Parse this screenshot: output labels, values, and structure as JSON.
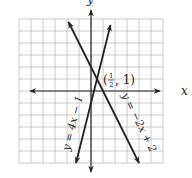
{
  "chart_data": {
    "type": "line",
    "title": "",
    "xlabel": "x",
    "ylabel": "y",
    "xlim": [
      -6,
      6
    ],
    "ylim": [
      -6,
      6
    ],
    "grid": true,
    "grid_step": 1,
    "series": [
      {
        "name": "y = 4x − 1",
        "slope": 4,
        "intercept": -1,
        "x": [
          -1.25,
          1.625
        ],
        "y": [
          -6,
          5.5
        ]
      },
      {
        "name": "y = −2x + 2",
        "slope": -2,
        "intercept": 2,
        "x": [
          -1.875,
          4
        ],
        "y": [
          5.75,
          -6
        ]
      }
    ],
    "annotations": [
      {
        "text": "(1/2, 1)",
        "x": 0.5,
        "y": 1,
        "label": "intersection point"
      }
    ]
  },
  "labels": {
    "x_axis": "x",
    "y_axis": "y",
    "line1": "y = 4x − 1",
    "line2": "y = −2x + 2",
    "point_open": "(",
    "point_num": "1",
    "point_den": "2",
    "point_close": ", 1)"
  }
}
